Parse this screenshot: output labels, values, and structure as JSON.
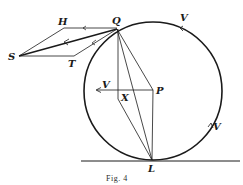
{
  "figure": {
    "caption": "Fig. 4",
    "colors": {
      "ink": "#1a1a1a",
      "background": "#ffffff"
    }
  },
  "points": {
    "Q": {
      "label": "Q",
      "x": 117,
      "y": 29
    },
    "H": {
      "label": "H",
      "x": 64,
      "y": 28
    },
    "S": {
      "label": "S",
      "x": 19,
      "y": 56
    },
    "T": {
      "label": "T",
      "x": 74,
      "y": 56
    },
    "P": {
      "label": "P",
      "x": 153,
      "y": 90
    },
    "X": {
      "label": "X",
      "x": 118,
      "y": 99
    },
    "L": {
      "label": "L",
      "x": 152,
      "y": 160
    }
  },
  "velocity_labels": {
    "top": "V",
    "left": "V",
    "right": "V"
  },
  "circle": {
    "cx": 153,
    "cy": 91,
    "r": 69
  },
  "ground_line": {
    "x1": 81,
    "x2": 240,
    "y": 161
  }
}
